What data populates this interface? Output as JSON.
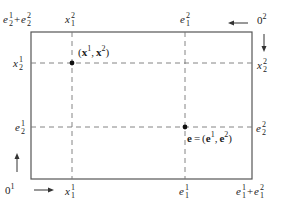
{
  "diagram": {
    "type": "edgeworth-box",
    "colors": {
      "line": "#555555",
      "dashed": "#777777",
      "dot": "#111111",
      "text": "#222222"
    },
    "box": {
      "left": 31,
      "top": 32,
      "right": 252,
      "bottom": 179
    },
    "labels": {
      "top_left_corner": {
        "base": "e",
        "parts": [
          {
            "base": "e",
            "sup": "1",
            "sub": "2"
          },
          {
            "op": "+"
          },
          {
            "base": "e",
            "sup": "2",
            "sub": "2"
          }
        ],
        "text": "e_2^1 + e_2^2"
      },
      "top_x1_2": {
        "base": "x",
        "sup": "2",
        "sub": "1",
        "text": "x_1^2"
      },
      "top_e1_2": {
        "base": "e",
        "sup": "2",
        "sub": "1",
        "text": "e_1^2"
      },
      "origin_2": {
        "base": "0",
        "sup": "2",
        "text": "0^2"
      },
      "left_x2_1": {
        "base": "x",
        "sup": "1",
        "sub": "2",
        "text": "x_2^1"
      },
      "left_e2_1": {
        "base": "e",
        "sup": "1",
        "sub": "2",
        "text": "e_2^1"
      },
      "right_x2_2": {
        "base": "x",
        "sup": "2",
        "sub": "2",
        "text": "x_2^2"
      },
      "right_e2_2": {
        "base": "e",
        "sup": "2",
        "sub": "2",
        "text": "e_2^2"
      },
      "origin_1": {
        "base": "0",
        "sup": "1",
        "text": "0^1"
      },
      "bottom_x1_1": {
        "base": "x",
        "sup": "1",
        "sub": "1",
        "text": "x_1^1"
      },
      "bottom_e1_1": {
        "base": "e",
        "sup": "1",
        "sub": "1",
        "text": "e_1^1"
      },
      "bottom_right_corner": {
        "text": "e_1^1 + e_1^2"
      },
      "point_x": {
        "text": "(x^1, x^2)"
      },
      "point_e": {
        "text": "e = (e^1, e^2)"
      }
    },
    "points": [
      {
        "name": "allocation-x",
        "label": "(x¹, x²)",
        "x": 72,
        "y": 63
      },
      {
        "name": "endowment-e",
        "label": "e = (e¹, e²)",
        "x": 185,
        "y": 127
      }
    ],
    "dashed_lines": [
      {
        "name": "x1-vertical",
        "orientation": "vertical",
        "x": 72
      },
      {
        "name": "e1-vertical",
        "orientation": "vertical",
        "x": 185
      },
      {
        "name": "x2-horizontal",
        "orientation": "horizontal",
        "y": 63
      },
      {
        "name": "e2-horizontal",
        "orientation": "horizontal",
        "y": 127
      }
    ],
    "arrows": [
      {
        "name": "origin1-right-arrow",
        "direction": "right"
      },
      {
        "name": "origin1-up-arrow",
        "direction": "up"
      },
      {
        "name": "origin2-left-arrow",
        "direction": "left"
      },
      {
        "name": "origin2-down-arrow",
        "direction": "down"
      }
    ],
    "symbols": {
      "plus": "+",
      "eq": "=",
      "open": "(",
      "close": ")",
      "comma": ",",
      "x": "x",
      "e": "e",
      "zero": "0",
      "one": "1",
      "two": "2"
    }
  }
}
